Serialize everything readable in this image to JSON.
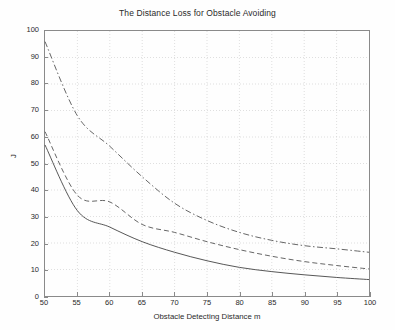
{
  "chart_data": {
    "type": "line",
    "title": "The Distance Loss for Obstacle Avoiding",
    "xlabel": "Obstacle Detecting Distance m",
    "ylabel": "J",
    "xlim": [
      50,
      100
    ],
    "ylim": [
      0,
      100
    ],
    "xticks": [
      50,
      55,
      60,
      65,
      70,
      75,
      80,
      85,
      90,
      95,
      100
    ],
    "yticks": [
      0,
      10,
      20,
      30,
      40,
      50,
      60,
      70,
      80,
      90,
      100
    ],
    "grid": true,
    "legend": "none",
    "x": [
      50,
      55,
      60,
      65,
      70,
      75,
      80,
      85,
      90,
      95,
      100
    ],
    "series": [
      {
        "name": "upper-curve",
        "style": "dash-dot",
        "color": "#555555",
        "values": [
          96,
          68,
          56.5,
          45,
          35,
          28.5,
          24,
          21,
          19,
          17.8,
          16.5
        ]
      },
      {
        "name": "middle-curve",
        "style": "dashed",
        "color": "#555555",
        "values": [
          62,
          38,
          35.5,
          27,
          24,
          20.5,
          17.5,
          15,
          13,
          11.5,
          10.2
        ]
      },
      {
        "name": "lower-curve",
        "style": "solid",
        "color": "#444444",
        "values": [
          57,
          32.2,
          26,
          20.5,
          16.5,
          13.3,
          10.8,
          9.2,
          8,
          7,
          6.2
        ]
      }
    ]
  }
}
